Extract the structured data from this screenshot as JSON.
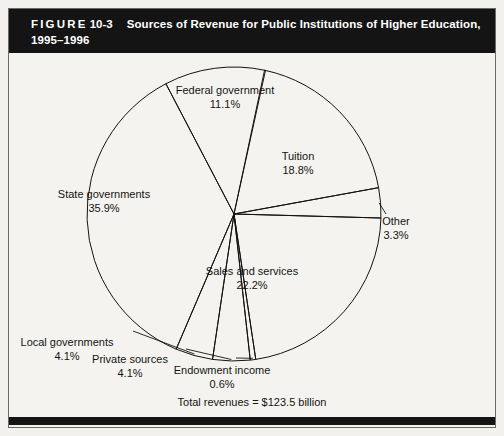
{
  "figure": {
    "label_word": "FIGURE",
    "number": "10-3",
    "caption_line1": "Sources of Revenue for Public Institutions of Higher Education,",
    "caption_line2": "1995–1996",
    "title_bg": "#141414",
    "title_fg": "#ffffff",
    "page_bg": "#f2f1ee",
    "stroke": "#15130f"
  },
  "footnote": "Total revenues = $123.5 billion",
  "chart_data": {
    "type": "pie",
    "title": "Sources of Revenue for Public Institutions of Higher Education, 1995–1996",
    "unit": "percent",
    "total_label": "Total revenues = $123.5 billion",
    "total_value": 123.5,
    "total_unit": "$ billion",
    "legend": "none",
    "grid": false,
    "categories": [
      "Tuition",
      "Other",
      "Sales and services",
      "Endowment income",
      "Private sources",
      "Local governments",
      "State governments",
      "Federal government"
    ],
    "values": [
      18.8,
      3.3,
      22.2,
      0.6,
      4.1,
      4.1,
      35.9,
      11.1
    ],
    "slices": [
      {
        "name": "Tuition",
        "value": 18.8,
        "label": "Tuition",
        "pct": "18.8%",
        "label_x": 298,
        "label_y": 150
      },
      {
        "name": "Other",
        "value": 3.3,
        "label": "Other",
        "pct": "3.3%",
        "label_x": 396,
        "label_y": 215
      },
      {
        "name": "Sales and services",
        "value": 22.2,
        "label": "Sales and services",
        "pct": "22.2%",
        "label_x": 252,
        "label_y": 265
      },
      {
        "name": "Endowment income",
        "value": 0.6,
        "label": "Endowment income",
        "pct": "0.6%",
        "label_x": 222,
        "label_y": 364
      },
      {
        "name": "Private sources",
        "value": 4.1,
        "label": "Private sources",
        "pct": "4.1%",
        "label_x": 130,
        "label_y": 353
      },
      {
        "name": "Local governments",
        "value": 4.1,
        "label": "Local governments",
        "pct": "4.1%",
        "label_x": 67,
        "label_y": 336
      },
      {
        "name": "State governments",
        "value": 35.9,
        "label": "State governments",
        "pct": "35.9%",
        "label_x": 104,
        "label_y": 188
      },
      {
        "name": "Federal government",
        "value": 11.1,
        "label": "Federal government",
        "pct": "11.1%",
        "label_x": 225,
        "label_y": 84
      }
    ],
    "geometry": {
      "cx": 234,
      "cy": 214,
      "r": 147,
      "start_angle_deg": 12
    }
  }
}
